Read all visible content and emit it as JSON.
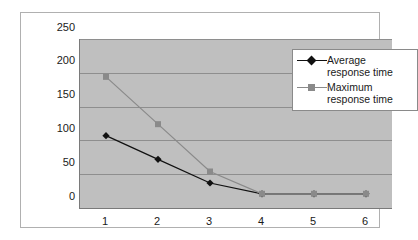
{
  "chart_data": {
    "type": "line",
    "title": "",
    "subtitle": "",
    "xlabel": "",
    "ylabel": "",
    "categories": [
      "1",
      "2",
      "3",
      "4",
      "5",
      "6"
    ],
    "series": [
      {
        "name": "Average response time",
        "values": [
          107,
          72,
          37,
          21,
          21,
          21
        ],
        "color": "#111111",
        "marker": "diamond"
      },
      {
        "name": "Maximum response time",
        "values": [
          194,
          124,
          54,
          21,
          21,
          21
        ],
        "color": "#8a8a8a",
        "marker": "square"
      }
    ],
    "ylim": [
      0,
      250
    ],
    "yticks": [
      0,
      50,
      100,
      150,
      200,
      250
    ],
    "ytick_labels": [
      "0",
      "50",
      "100",
      "150",
      "200",
      "250"
    ],
    "xtick_labels": [
      "1",
      "2",
      "3",
      "4",
      "5",
      "6"
    ],
    "grid": "horizontal",
    "legend_position": "top-right",
    "plot_background": "#bfbfbf",
    "chart_background": "#ffffff"
  },
  "legend": {
    "entries": [
      {
        "label": "Average response time",
        "marker_name": "diamond-marker-icon"
      },
      {
        "label": "Maximum response time",
        "marker_name": "square-marker-icon"
      }
    ]
  }
}
